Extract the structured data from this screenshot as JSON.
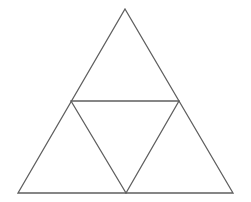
{
  "figure": {
    "name": "subdivided-equilateral-triangle",
    "background_color": "#ffffff",
    "canvas": {
      "width": 251,
      "height": 202
    }
  },
  "style": {
    "stroke_color": "#5f5f5f",
    "stroke_width": 1.3,
    "fill": "none"
  },
  "chart_data": {
    "type": "diagram",
    "shape": "triangle-subdivision",
    "iteration": 1,
    "region_count": 4,
    "points": {
      "apex": {
        "label": "apex",
        "x": 125,
        "y": 9
      },
      "bottom_left": {
        "label": "bottom-left",
        "x": 18,
        "y": 193
      },
      "bottom_right": {
        "label": "bottom-right",
        "x": 233,
        "y": 193
      },
      "left_midpoint": {
        "label": "left-midpoint",
        "x": 71,
        "y": 101
      },
      "right_midpoint": {
        "label": "right-midpoint",
        "x": 179,
        "y": 101
      },
      "bottom_midpoint": {
        "label": "bottom-midpoint",
        "x": 126,
        "y": 193
      }
    },
    "outer_triangle": {
      "name": "outer-triangle",
      "points": "125,9 233,193 18,193"
    },
    "segments": [
      {
        "name": "outer-left-edge",
        "x1": 125,
        "y1": 9,
        "x2": 18,
        "y2": 193
      },
      {
        "name": "outer-right-edge",
        "x1": 125,
        "y1": 9,
        "x2": 233,
        "y2": 193
      },
      {
        "name": "outer-base-edge",
        "x1": 18,
        "y1": 193,
        "x2": 233,
        "y2": 193
      },
      {
        "name": "midsegment-horizontal",
        "x1": 71,
        "y1": 101,
        "x2": 179,
        "y2": 101
      },
      {
        "name": "midsegment-left-descending",
        "x1": 71,
        "y1": 101,
        "x2": 126,
        "y2": 193
      },
      {
        "name": "midsegment-right-descending",
        "x1": 179,
        "y1": 101,
        "x2": 126,
        "y2": 193
      }
    ],
    "regions": [
      {
        "name": "top-triangle",
        "orientation": "upward",
        "points": "125,9 179,101 71,101"
      },
      {
        "name": "left-triangle",
        "orientation": "upward",
        "points": "71,101 126,193 18,193"
      },
      {
        "name": "right-triangle",
        "orientation": "upward",
        "points": "179,101 233,193 126,193"
      },
      {
        "name": "center-triangle",
        "orientation": "downward",
        "points": "71,101 179,101 126,193"
      }
    ]
  }
}
